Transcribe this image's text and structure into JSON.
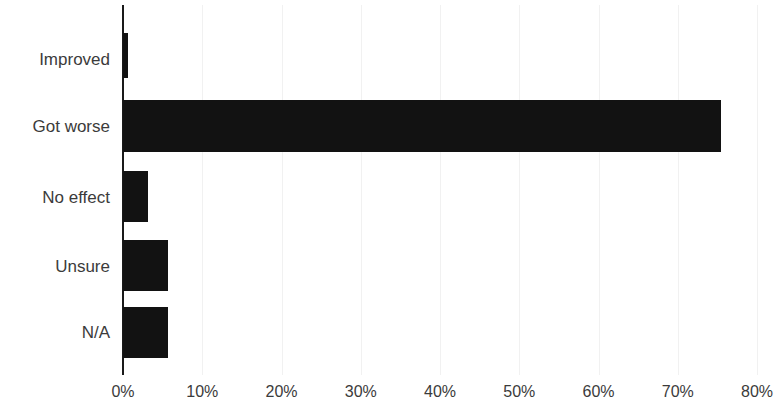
{
  "chart_data": {
    "type": "bar",
    "orientation": "horizontal",
    "title": "",
    "subtitle": "",
    "xlabel": "",
    "ylabel": "",
    "categories": [
      "Improved",
      "Got worse",
      "No effect",
      "Unsure",
      "N/A"
    ],
    "values": [
      0.6,
      75.5,
      3.2,
      5.7,
      5.7
    ],
    "value_suffix": "%",
    "xlim": [
      0,
      80
    ],
    "x_ticks": [
      0,
      10,
      20,
      30,
      40,
      50,
      60,
      70,
      80
    ],
    "x_tick_labels": [
      "0%",
      "10%",
      "20%",
      "30%",
      "40%",
      "50%",
      "60%",
      "70%",
      "80%"
    ],
    "grid": "vertical-faint",
    "legend": null,
    "legend_position": "none",
    "bar_color": "#121212",
    "axis_color": "#1a1a1a",
    "tick_label_color": "#3b3b3b",
    "gridline_color": "#f1f1f1",
    "background_color": "#ffffff",
    "annotations": []
  }
}
